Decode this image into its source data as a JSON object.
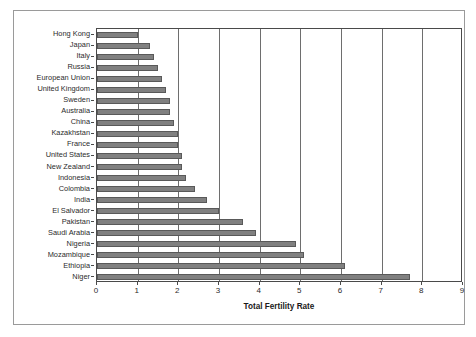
{
  "chart_data": {
    "type": "bar",
    "orientation": "horizontal",
    "title": "",
    "xlabel": "Total Fertility Rate",
    "ylabel": "",
    "xlim": [
      0,
      9
    ],
    "xticks": [
      0,
      1,
      2,
      3,
      4,
      5,
      6,
      7,
      8,
      9
    ],
    "grid": true,
    "legend": false,
    "bar_color": "#808080",
    "categories": [
      "Hong Kong",
      "Japan",
      "Italy",
      "Russia",
      "European Union",
      "United Kingdom",
      "Sweden",
      "Australia",
      "China",
      "Kazakhstan",
      "France",
      "United States",
      "New Zealand",
      "Indonesia",
      "Colombia",
      "India",
      "El Salvador",
      "Pakistan",
      "Saudi Arabia",
      "Nigeria",
      "Mozambique",
      "Ethiopia",
      "Niger"
    ],
    "values": [
      1.0,
      1.3,
      1.4,
      1.5,
      1.6,
      1.7,
      1.8,
      1.8,
      1.9,
      2.0,
      2.0,
      2.1,
      2.1,
      2.2,
      2.4,
      2.7,
      3.0,
      3.6,
      3.9,
      4.9,
      5.1,
      6.1,
      7.7
    ]
  }
}
